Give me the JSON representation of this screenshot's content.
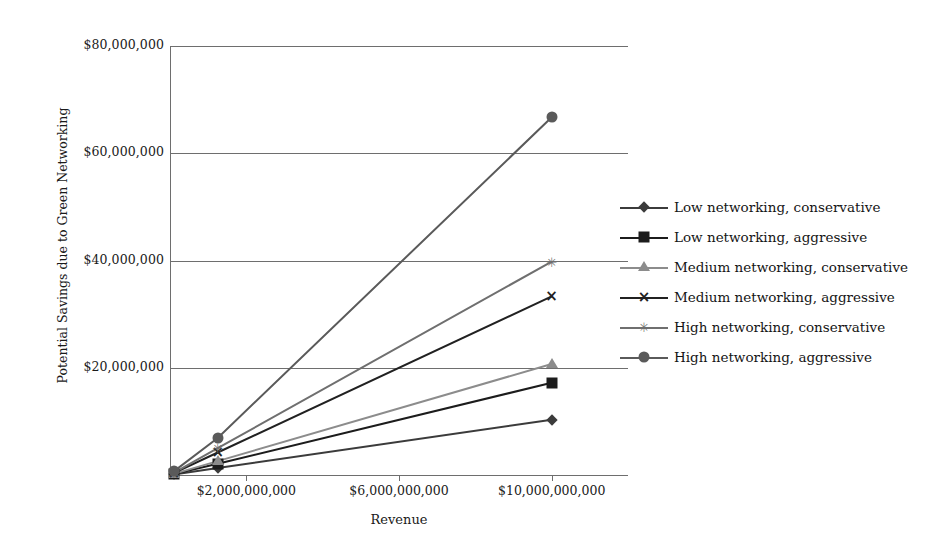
{
  "chart_data": {
    "type": "line",
    "title": "",
    "xlabel": "Revenue",
    "ylabel": "Potential Savings due to Green Networking",
    "x": [
      100000000,
      1250000000,
      10000000000
    ],
    "xlim": [
      0,
      12000000000
    ],
    "ylim": [
      0,
      80000000
    ],
    "grid": true,
    "legend_position": "right",
    "x_tick_labels": [
      "$2,000,000,000",
      "$6,000,000,000",
      "$10,000,000,000"
    ],
    "x_tick_values": [
      2000000000,
      6000000000,
      10000000000
    ],
    "y_tick_labels": [
      "$20,000,000",
      "$40,000,000",
      "$60,000,000",
      "$80,000,000"
    ],
    "y_tick_values": [
      20000000,
      40000000,
      60000000,
      80000000
    ],
    "series": [
      {
        "name": "Low networking, conservative",
        "marker": "diamond",
        "color": "#3b3b3b",
        "values": [
          100000,
          1300000,
          10300000
        ]
      },
      {
        "name": "Low networking, aggressive",
        "marker": "square",
        "color": "#1c1c1c",
        "values": [
          180000,
          2100000,
          17200000
        ]
      },
      {
        "name": "Medium networking, conservative",
        "marker": "triangle",
        "color": "#8c8c8c",
        "values": [
          210000,
          2600000,
          20700000
        ]
      },
      {
        "name": "Medium networking, aggressive",
        "marker": "cross",
        "color": "#212121",
        "values": [
          340000,
          4200000,
          33300000
        ]
      },
      {
        "name": "High networking, conservative",
        "marker": "star",
        "color": "#6f6f6f",
        "values": [
          400000,
          5000000,
          39800000
        ]
      },
      {
        "name": "High networking, aggressive",
        "marker": "circle",
        "color": "#5a5a5a",
        "values": [
          680000,
          6900000,
          66700000
        ]
      }
    ]
  },
  "legend": {
    "items": [
      "Low networking, conservative",
      "Low networking, aggressive",
      "Medium networking, conservative",
      "Medium networking, aggressive",
      "High networking, conservative",
      "High networking, aggressive"
    ]
  },
  "axes": {
    "x_title": "Revenue",
    "y_title": "Potential Savings due to Green Networking"
  }
}
